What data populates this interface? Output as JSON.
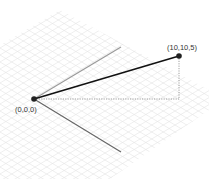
{
  "diagram": {
    "type": "3d-vector-isometric",
    "origin": {
      "label": "(0,0,0)",
      "x": 34,
      "y": 99
    },
    "point": {
      "label": "(10,10,5)",
      "x": 179,
      "y": 56
    },
    "projection_corner": {
      "x": 179,
      "y": 99
    },
    "axes": [
      {
        "name": "axis-upper",
        "x2": 121,
        "y2": 47,
        "color": "#999999"
      },
      {
        "name": "axis-lower",
        "x2": 121,
        "y2": 152,
        "color": "#666666"
      }
    ],
    "colors": {
      "vector": "#111111",
      "point": "#222222",
      "dashed": "#888888",
      "grid": "#e6e6e6"
    }
  }
}
